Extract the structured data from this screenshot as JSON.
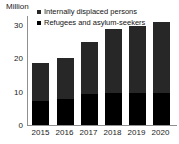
{
  "chart_data": {
    "type": "bar",
    "subtype": "stacked-column",
    "title": "",
    "ylabel": "Million",
    "xlabel": "",
    "categories": [
      "2015",
      "2016",
      "2017",
      "2018",
      "2019",
      "2020"
    ],
    "series": [
      {
        "name": "Refugees and asylum-seekers",
        "color": "#000000",
        "values": [
          6.4,
          7.0,
          8.4,
          8.6,
          8.7,
          8.7
        ]
      },
      {
        "name": "Internally displaced persons",
        "color": "#272727",
        "values": [
          10.3,
          11.0,
          14.0,
          17.3,
          18.1,
          19.1
        ]
      }
    ],
    "totals": [
      16.7,
      18.0,
      22.4,
      25.9,
      26.8,
      27.8
    ],
    "ylim": [
      0,
      30
    ],
    "yticks": [
      "0",
      "10",
      "20",
      "30"
    ],
    "grid": false,
    "legend_position": "top-right",
    "stack_order_bottom_to_top": [
      "Refugees and asylum-seekers",
      "Internally displaced persons"
    ]
  },
  "axis": {
    "y_title": "Million",
    "y_ticks": [
      "30",
      "20",
      "10",
      "0"
    ],
    "x_ticks": [
      "2015",
      "2016",
      "2017",
      "2018",
      "2019",
      "2020"
    ]
  },
  "legend": {
    "items": [
      {
        "label": "Internally displaced persons",
        "color": "#272727",
        "marker": "square-marker"
      },
      {
        "label": "Refugees and asylum-seekers",
        "color": "#000000",
        "marker": "square-marker"
      }
    ]
  }
}
